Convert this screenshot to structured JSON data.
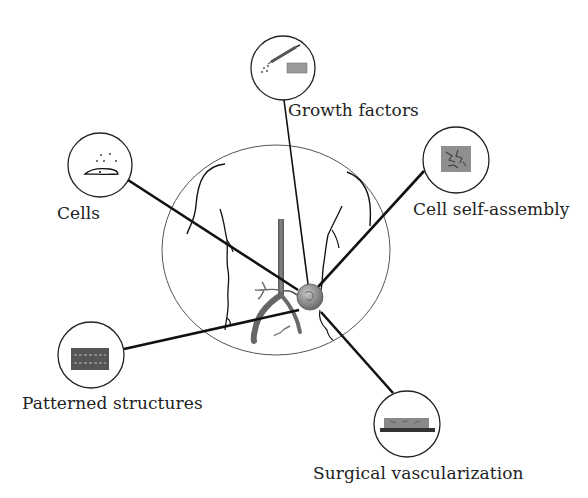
{
  "diagram": {
    "title": "",
    "central_element": "patient torso with vascularized implant",
    "nodes": [
      {
        "id": "growth-factors",
        "label": "Growth factors",
        "icon": "syringe-and-scaffold-icon"
      },
      {
        "id": "cells",
        "label": "Cells",
        "icon": "cell-icon"
      },
      {
        "id": "cell-self-assembly",
        "label": "Cell self-assembly",
        "icon": "network-scaffold-icon"
      },
      {
        "id": "patterned-structures",
        "label": "Patterned structures",
        "icon": "patterned-channels-icon"
      },
      {
        "id": "surgical-vascularization",
        "label": "Surgical vascularization",
        "icon": "vessel-graft-icon"
      }
    ],
    "colors": {
      "line": "#111111",
      "outline": "#555555",
      "sphere": "#8a8a8a",
      "vessel": "#666666",
      "icon_fill": "#7a7a7a"
    }
  }
}
